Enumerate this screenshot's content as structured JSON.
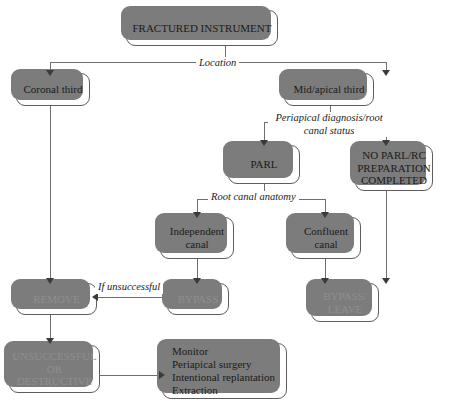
{
  "diagram": {
    "colors": {
      "node_border": "#5d5d5d",
      "node_shadow": "#7c7c7c",
      "node_fill": "#ffffff",
      "text": "#1b1b1b",
      "muted_text": "#8f8f8f",
      "connector": "#6f6f6f",
      "arrow": "#3a3a3a"
    },
    "nodes": {
      "fractured_instrument": "FRACTURED INSTRUMENT",
      "coronal_third": "Coronal third",
      "mid_apical_third": "Mid/apical third",
      "parl": "PARL",
      "no_parl": {
        "line1": "NO PARL/RC",
        "line2": "PREPARATION",
        "line3": "COMPLETED"
      },
      "independent_canal": {
        "line1": "Independent",
        "line2": "canal"
      },
      "confluent_canal": {
        "line1": "Confluent",
        "line2": "canal"
      },
      "remove": "REMOVE",
      "bypass": "BYPASS",
      "bypass_leave": {
        "line1": "BYPASS/",
        "line2": "LEAVE"
      },
      "unsuccessful_or_destructive": {
        "line1": "UNSUCCESSFUL",
        "line2": "OR",
        "line3": "DESTRUCTIVE"
      },
      "outcomes": {
        "line1": "Monitor",
        "line2": "Periapical surgery",
        "line3": "Intentional replantation",
        "line4": "Extraction"
      }
    },
    "edge_labels": {
      "location": "Location",
      "periapical_diagnosis": {
        "line1": "Periapical diagnosis/root",
        "line2": "canal status"
      },
      "root_canal_anatomy": "Root canal anatomy",
      "if_unsuccessful": "If unsuccessful"
    }
  }
}
